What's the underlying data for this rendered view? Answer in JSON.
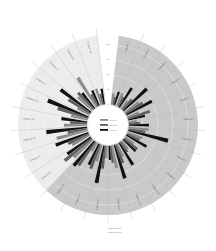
{
  "chart_data": {
    "type": "bar",
    "layout": "radial",
    "title": "",
    "legend": {
      "placement": "center",
      "entries": [
        "Series A",
        "Series B",
        "Series C"
      ]
    },
    "series_colors": [
      "#8a8a8a",
      "#5e5e5e",
      "#111111"
    ],
    "regions": [
      {
        "name": "light region",
        "from_category": 15,
        "to_category": 23,
        "color": "#ececec"
      },
      {
        "name": "grey region",
        "from_category": 0,
        "to_category": 14,
        "color": "#c9c9c9"
      }
    ],
    "radial_axis": {
      "range": [
        0,
        100
      ],
      "ticks": [
        "0",
        "25",
        "50",
        "75",
        "100"
      ]
    },
    "categories": [
      "Category 1",
      "Category 2",
      "Category 3",
      "Category 4",
      "Category 5",
      "Category 6",
      "Category 7",
      "Category 8",
      "Category 9",
      "Category 10",
      "Category 11",
      "Category 12",
      "Category 13",
      "Category 14",
      "Category 15",
      "Category 16",
      "Category 17",
      "Category 18",
      "Category 19",
      "Category 20",
      "Category 21",
      "Category 22",
      "Category 23",
      "Category 24"
    ],
    "series": [
      {
        "name": "Series A",
        "values": [
          20,
          25,
          18,
          30,
          22,
          15,
          35,
          28,
          20,
          18,
          25,
          40,
          22,
          30,
          18,
          45,
          35,
          55,
          40,
          30,
          25,
          35,
          60,
          30
        ]
      },
      {
        "name": "Series B",
        "values": [
          15,
          20,
          25,
          35,
          40,
          20,
          30,
          25,
          30,
          22,
          35,
          30,
          40,
          45,
          50,
          60,
          40,
          35,
          30,
          55,
          45,
          40,
          25,
          20
        ]
      },
      {
        "name": "Series C",
        "values": [
          25,
          40,
          55,
          50,
          30,
          35,
          70,
          40,
          30,
          45,
          60,
          25,
          65,
          40,
          55,
          50,
          60,
          70,
          45,
          75,
          65,
          35,
          30,
          28
        ]
      }
    ],
    "footnote": [
      "Footnote line 1",
      "Footnote line 2"
    ]
  }
}
